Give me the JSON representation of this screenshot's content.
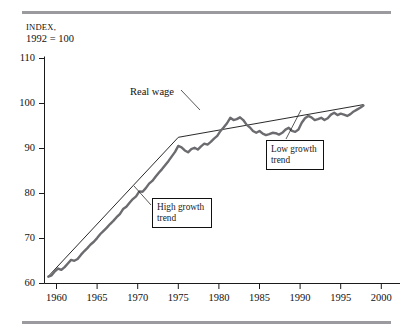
{
  "figure": {
    "rules": {
      "color": "#9a9a9f"
    },
    "axis_caption_line1": "Index,",
    "axis_caption_line2": "1992 = 100"
  },
  "chart_data": {
    "type": "line",
    "title": "",
    "subtitle": "",
    "xlabel": "",
    "ylabel": "Index, 1992 = 100",
    "xlim": [
      1958.5,
      2001.5
    ],
    "ylim": [
      60,
      110
    ],
    "grid": false,
    "legend": "none",
    "xticks": [
      1960,
      1965,
      1970,
      1975,
      1980,
      1985,
      1990,
      1995,
      2000
    ],
    "yticks": [
      60,
      70,
      80,
      90,
      100,
      110
    ],
    "xtick_labels": [
      "1960",
      "1965",
      "1970",
      "1975",
      "1980",
      "1985",
      "1990",
      "1995",
      "2000"
    ],
    "ytick_labels": [
      "60",
      "70",
      "80",
      "90",
      "100",
      "110"
    ],
    "series": [
      {
        "name": "Real wage",
        "color": "#6b6b70",
        "style": "thick-solid",
        "x": [
          1959.0,
          1959.4,
          1959.8,
          1960.2,
          1960.6,
          1961.0,
          1961.4,
          1961.8,
          1962.2,
          1962.6,
          1963.0,
          1963.4,
          1963.8,
          1964.2,
          1964.6,
          1965.0,
          1965.4,
          1965.8,
          1966.2,
          1966.6,
          1967.0,
          1967.4,
          1967.8,
          1968.2,
          1968.6,
          1969.0,
          1969.4,
          1969.8,
          1970.2,
          1970.6,
          1971.0,
          1971.4,
          1971.8,
          1972.2,
          1972.6,
          1973.0,
          1973.4,
          1973.8,
          1974.2,
          1974.6,
          1975.0,
          1975.4,
          1975.8,
          1976.2,
          1976.6,
          1977.0,
          1977.4,
          1977.8,
          1978.2,
          1978.6,
          1979.0,
          1979.4,
          1979.8,
          1980.2,
          1980.6,
          1981.0,
          1981.4,
          1981.8,
          1982.2,
          1982.6,
          1983.0,
          1983.4,
          1983.8,
          1984.2,
          1984.6,
          1985.0,
          1985.4,
          1985.8,
          1986.2,
          1986.6,
          1987.0,
          1987.4,
          1987.8,
          1988.2,
          1988.6,
          1989.0,
          1989.4,
          1989.8,
          1990.2,
          1990.6,
          1991.0,
          1991.4,
          1991.8,
          1992.2,
          1992.6,
          1993.0,
          1993.4,
          1993.8,
          1994.2,
          1994.6,
          1995.0,
          1995.4,
          1995.8,
          1996.2,
          1996.6,
          1997.0,
          1997.4,
          1997.8
        ],
        "y": [
          61.5,
          61.8,
          62.7,
          63.3,
          63.0,
          63.6,
          64.4,
          65.2,
          65.0,
          65.4,
          66.3,
          67.1,
          67.8,
          68.6,
          69.2,
          70.0,
          70.9,
          71.6,
          72.3,
          73.1,
          73.8,
          74.6,
          75.3,
          76.4,
          76.9,
          77.8,
          78.6,
          79.2,
          80.3,
          80.2,
          81.0,
          82.0,
          82.6,
          83.5,
          84.4,
          85.2,
          86.1,
          87.0,
          88.0,
          89.0,
          90.3,
          90.0,
          89.3,
          88.9,
          89.6,
          89.9,
          89.5,
          90.2,
          90.8,
          90.6,
          91.2,
          91.9,
          92.5,
          93.6,
          94.4,
          95.3,
          96.5,
          96.0,
          96.2,
          96.6,
          96.0,
          95.0,
          94.4,
          93.6,
          93.2,
          93.6,
          93.0,
          92.7,
          92.9,
          93.2,
          93.1,
          92.8,
          93.2,
          93.9,
          94.3,
          93.6,
          93.4,
          93.9,
          95.4,
          96.4,
          96.9,
          96.6,
          96.0,
          96.2,
          96.5,
          96.0,
          96.4,
          97.2,
          97.6,
          97.1,
          97.4,
          97.2,
          96.9,
          97.3,
          97.9,
          98.3,
          98.7,
          99.2
        ],
        "note": "wiggly real wage index series, 1959-1997"
      },
      {
        "name": "High growth trend",
        "color": "#111111",
        "style": "thin-straight",
        "x": [
          1959.0,
          1975.0
        ],
        "y": [
          61.6,
          92.2
        ]
      },
      {
        "name": "Low growth trend",
        "color": "#111111",
        "style": "thin-straight",
        "x": [
          1975.0,
          1997.8
        ],
        "y": [
          92.2,
          99.4
        ]
      }
    ],
    "annotations": [
      {
        "id": "real-wage",
        "text": "Real wage",
        "kind": "text-with-leader"
      },
      {
        "id": "low-growth",
        "text": "Low growth\ntrend",
        "text_line1": "Low growth",
        "text_line2": "trend",
        "kind": "boxed-callout"
      },
      {
        "id": "high-growth",
        "text": "High growth\ntrend",
        "text_line1": "High growth",
        "text_line2": "trend",
        "kind": "boxed-callout"
      }
    ]
  }
}
